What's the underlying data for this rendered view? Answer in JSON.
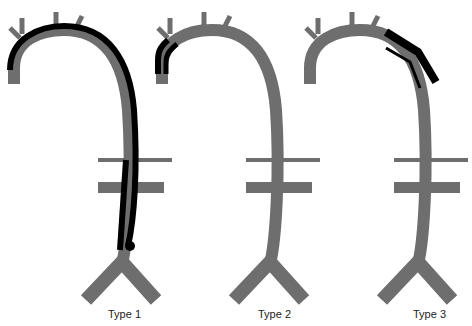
{
  "figure": {
    "colors": {
      "aorta": "#6e6e6e",
      "dissection": "#000000",
      "background": "#ffffff"
    },
    "panels": [
      {
        "label": "Type 1",
        "dissection_extent": "ascending arch through descending aorta"
      },
      {
        "label": "Type 2",
        "dissection_extent": "ascending aorta only"
      },
      {
        "label": "Type 3",
        "dissection_extent": "descending thoracic aorta"
      }
    ]
  }
}
